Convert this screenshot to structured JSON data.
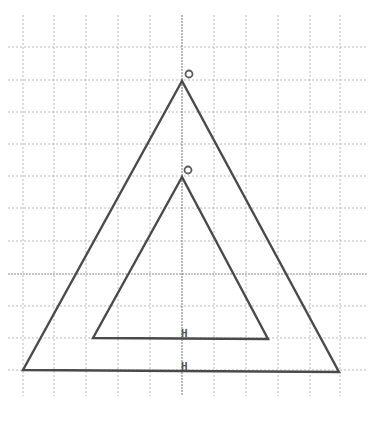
{
  "diagram": {
    "title": "",
    "background": "#ffffff",
    "colors": {
      "grid": "#b9b9b9",
      "axis": "#8a8a8a",
      "stroke": "#4a4a4a",
      "label": "#555555"
    },
    "grid": {
      "x_lines": [
        23,
        54,
        86,
        118,
        150,
        214,
        246,
        278,
        310,
        340
      ],
      "y_lines": [
        47,
        80,
        112,
        144,
        176,
        208,
        241,
        306,
        338,
        370
      ],
      "x_extent": [
        8,
        367
      ],
      "y_extent": [
        15,
        396
      ],
      "axis_x": 182,
      "axis_y": 274
    },
    "triangles": [
      {
        "name": "outer-triangle",
        "points": "182,81 23,370 339,372",
        "apex": {
          "x": 182,
          "y": 81
        },
        "apex_mark": {
          "cx": 189,
          "cy": 74,
          "r": 3.5,
          "label": "O"
        },
        "base_label": {
          "text": "H",
          "x": 181,
          "y": 370
        }
      },
      {
        "name": "inner-triangle",
        "points": "182,177 93,338 268,339",
        "apex": {
          "x": 182,
          "y": 177
        },
        "apex_mark": {
          "cx": 188,
          "cy": 170,
          "r": 3.5,
          "label": "O"
        },
        "base_label": {
          "text": "H",
          "x": 181,
          "y": 337
        }
      }
    ]
  }
}
